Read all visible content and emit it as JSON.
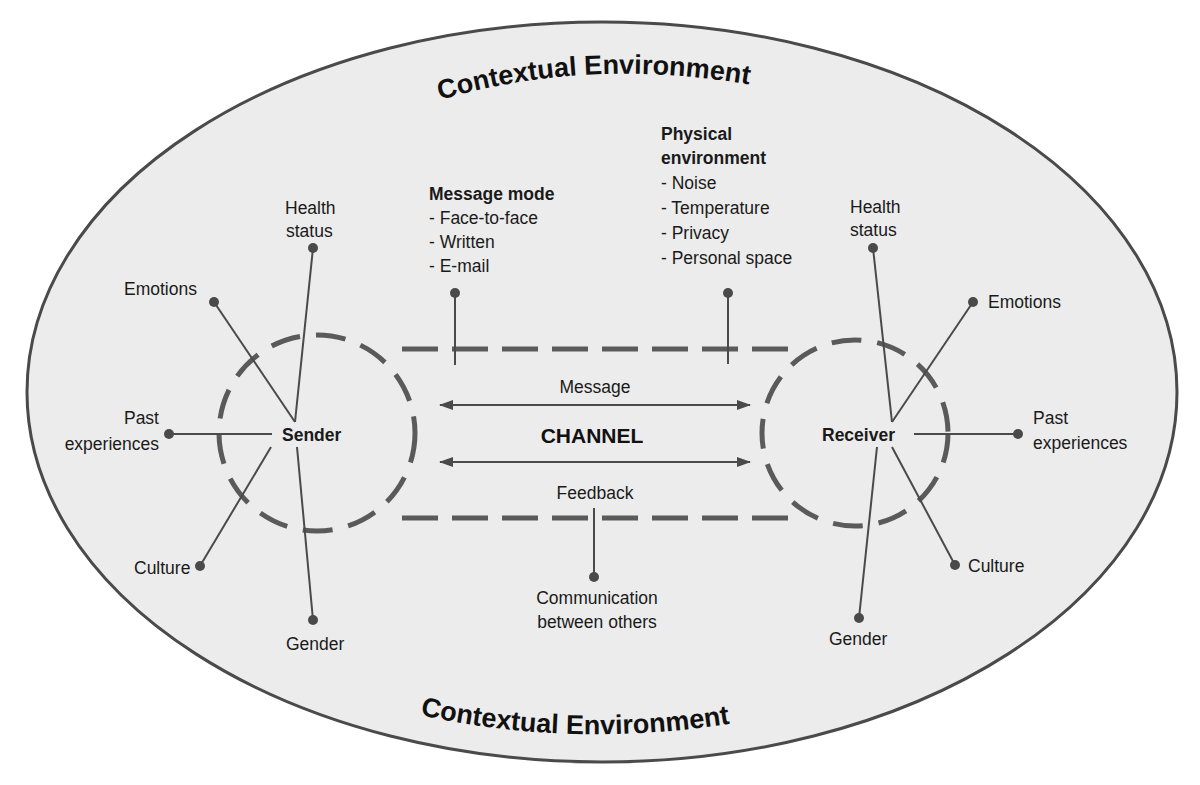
{
  "diagram": {
    "title_top": "Contextual Environment",
    "title_bottom": "Contextual Environment",
    "channel_label": "CHANNEL",
    "message_label": "Message",
    "feedback_label": "Feedback",
    "sender": {
      "label": "Sender",
      "factors": {
        "health_line1": "Health",
        "health_line2": "status",
        "emotions": "Emotions",
        "past_line1": "Past",
        "past_line2": "experiences",
        "culture": "Culture",
        "gender": "Gender"
      }
    },
    "receiver": {
      "label": "Receiver",
      "factors": {
        "health_line1": "Health",
        "health_line2": "status",
        "emotions": "Emotions",
        "past_line1": "Past",
        "past_line2": "experiences",
        "culture": "Culture",
        "gender": "Gender"
      }
    },
    "message_mode": {
      "heading": "Message mode",
      "items": [
        "- Face-to-face",
        "- Written",
        "- E-mail"
      ]
    },
    "physical_environment": {
      "heading_line1": "Physical",
      "heading_line2": "environment",
      "items": [
        "- Noise",
        "- Temperature",
        "- Privacy",
        "- Personal space"
      ]
    },
    "communication_between_others": {
      "line1": "Communication",
      "line2": "between others"
    },
    "colors": {
      "ellipse_fill": "#ececec",
      "ellipse_stroke": "#4a4a4a",
      "dash_stroke": "#5a5a5a",
      "line_stroke": "#4a4a4a",
      "text": "#1a1a1a"
    }
  }
}
